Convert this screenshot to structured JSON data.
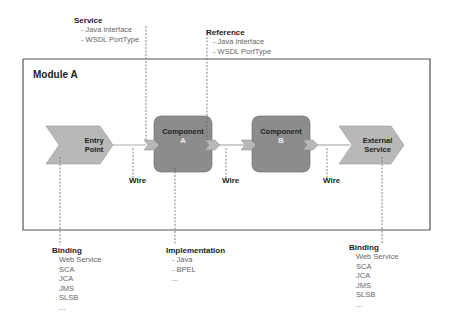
{
  "module": {
    "title": "Module A"
  },
  "annotations": {
    "service": {
      "title": "Service",
      "items": [
        "- Java interface",
        "- WSDL PortType"
      ]
    },
    "reference": {
      "title": "Reference",
      "items": [
        "- Java interface",
        "- WSDL PortType"
      ]
    },
    "implementation": {
      "title": "Implementation",
      "items": [
        "- Java",
        "- BPEL",
        "..."
      ]
    },
    "binding_left": {
      "title": "Binding",
      "items": [
        "Web Service",
        "SCA",
        "JCA",
        "JMS",
        "SLSB",
        "..."
      ]
    },
    "binding_right": {
      "title": "Binding",
      "items": [
        "Web Service",
        "SCA",
        "JCA",
        "JMS",
        "SLSB",
        "..."
      ]
    }
  },
  "nodes": {
    "entry_point": {
      "line1": "Entry",
      "line2": "Point"
    },
    "component_a": {
      "line1": "Component",
      "line2": "A"
    },
    "component_b": {
      "line1": "Component",
      "line2": "B"
    },
    "external_service": {
      "line1": "External",
      "line2": "Service"
    }
  },
  "wires": [
    "Wire",
    "Wire",
    "Wire"
  ],
  "colors": {
    "chevron_fill": "#b8b8b8",
    "component_fill": "#8c8c8c",
    "border": "#555555",
    "wire": "#aaaaaa"
  }
}
